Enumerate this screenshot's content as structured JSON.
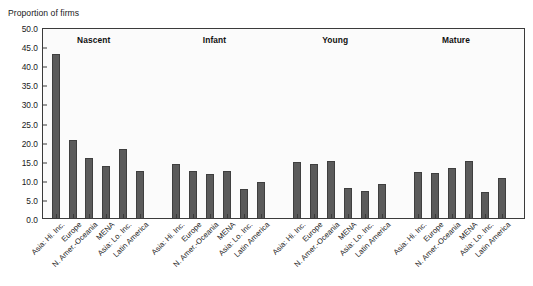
{
  "chart_data": {
    "type": "bar",
    "title": "",
    "ylabel": "Proportion of firms",
    "xlabel": "",
    "ylim": [
      0.0,
      50.0
    ],
    "ytick_labels": [
      "50.0",
      "45.0",
      "40.0",
      "35.0",
      "30.0",
      "25.0",
      "20.0",
      "15.0",
      "10.0",
      "5.0",
      "0.0"
    ],
    "ytick_values": [
      50.0,
      45.0,
      40.0,
      35.0,
      30.0,
      25.0,
      20.0,
      15.0,
      10.0,
      5.0,
      0.0
    ],
    "grid": false,
    "legend": "none",
    "categories": [
      "Asia: Hi. Inc.",
      "Europe",
      "N. Amer.-Oceania",
      "MENA",
      "Asia: Lo. Inc.",
      "Latin America"
    ],
    "groups": [
      {
        "name": "Nascent",
        "values": [
          43.0,
          20.5,
          15.7,
          13.5,
          18.0,
          12.2
        ]
      },
      {
        "name": "Infant",
        "values": [
          14.1,
          12.2,
          11.6,
          12.4,
          7.6,
          9.3
        ]
      },
      {
        "name": "Young",
        "values": [
          14.7,
          14.2,
          14.9,
          7.9,
          7.2,
          8.9
        ]
      },
      {
        "name": "Mature",
        "values": [
          12.0,
          11.9,
          13.2,
          15.0,
          6.9,
          10.5
        ]
      }
    ],
    "series": [
      {
        "name": "Nascent",
        "values": [
          43.0,
          20.5,
          15.7,
          13.5,
          18.0,
          12.2
        ]
      },
      {
        "name": "Infant",
        "values": [
          14.1,
          12.2,
          11.6,
          12.4,
          7.6,
          9.3
        ]
      },
      {
        "name": "Young",
        "values": [
          14.7,
          14.2,
          14.9,
          7.9,
          7.2,
          8.9
        ]
      },
      {
        "name": "Mature",
        "values": [
          12.0,
          11.9,
          13.2,
          15.0,
          6.9,
          10.5
        ]
      }
    ],
    "colors": {
      "bar_fill": "#5b5b5b",
      "bar_edge": "#3f3f3f",
      "plot_background": "#fbfbfb",
      "frame": "#3b3b3b",
      "text": "#1a1a1a"
    }
  }
}
